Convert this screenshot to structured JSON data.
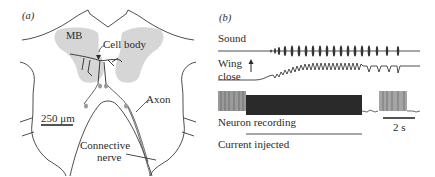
{
  "figure": {
    "panel_a": {
      "label": "(a)",
      "region_label": "MB",
      "cell_body_label": "Cell body",
      "axon_label": "Axon",
      "nerve_label_line1": "Connective",
      "nerve_label_line2": "nerve",
      "scale_bar": "250 μm"
    },
    "panel_b": {
      "label": "(b)",
      "trace1_label": "Sound",
      "trace2_label_line1": "Wing",
      "trace2_label_line2": "close",
      "arrow_symbol": "↑",
      "trace3_label": "Neuron recording",
      "time_scale": "2 s",
      "stimulus_label": "Current injected"
    }
  },
  "colors": {
    "line": "#3a3a3a",
    "mb_fill": "#cfcfcf",
    "recording_dark": "#2a2a2a"
  }
}
